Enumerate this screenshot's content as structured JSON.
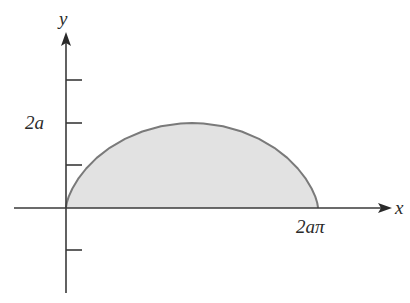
{
  "figure": {
    "type": "cycloid-arch-area",
    "curve": "x = a(t - sin t), y = a(1 - cos t), 0 <= t <= 2π",
    "axes": {
      "x_label": "x",
      "y_label": "y"
    },
    "labels": {
      "y_tick_2a": "2a",
      "x_tick_2api": "2aπ"
    },
    "ticks": {
      "y_ticks_count_above": 3,
      "y_ticks_count_below": 1
    },
    "colors": {
      "axis": "#3a3a3a",
      "curve_stroke": "#7a7a7a",
      "region_fill": "#e2e2e2",
      "text": "#2a2a2a"
    }
  }
}
